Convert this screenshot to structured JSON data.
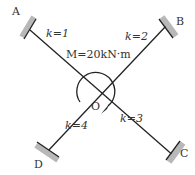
{
  "diagram": {
    "center_label": "O",
    "moment_label": "M=20kN·m",
    "supports": [
      {
        "id": "A",
        "label": "A"
      },
      {
        "id": "B",
        "label": "B"
      },
      {
        "id": "C",
        "label": "C"
      },
      {
        "id": "D",
        "label": "D"
      }
    ],
    "members": [
      {
        "label": "k=1"
      },
      {
        "label": "k=2"
      },
      {
        "label": "k=3"
      },
      {
        "label": "k=4"
      }
    ],
    "colors": {
      "line": "#222222",
      "wall": "#b8b8b8"
    }
  }
}
